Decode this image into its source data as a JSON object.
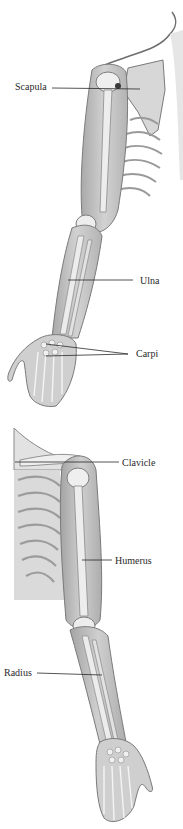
{
  "diagram": {
    "colors": {
      "background": "#ffffff",
      "skin": "#c9c9c9",
      "skin_dark": "#9a9a9a",
      "bone": "#ececec",
      "outline": "#6e6e6e",
      "leader_line": "#2a2a2a",
      "label_text": "#2a2a2a"
    },
    "figures": [
      {
        "id": "posterior-view",
        "labels": [
          {
            "text": "Scapula",
            "x": 15,
            "y": 80,
            "line": [
              [
                52,
                88
              ],
              [
                140,
                89
              ]
            ]
          },
          {
            "text": "Ulna",
            "x": 140,
            "y": 277,
            "line": [
              [
                68,
                280
              ],
              [
                133,
                280
              ]
            ]
          },
          {
            "text": "Carpi",
            "x": 136,
            "y": 349,
            "lines": [
              [
                [
                  46,
                  344
                ],
                [
                  128,
                  354
                ]
              ],
              [
                [
                  46,
                  356
                ],
                [
                  128,
                  354
                ]
              ]
            ]
          }
        ]
      },
      {
        "id": "anterior-view",
        "labels": [
          {
            "text": "Clavicle",
            "x": 122,
            "y": 457,
            "line": [
              [
                15,
                462
              ],
              [
                119,
                462
              ]
            ]
          },
          {
            "text": "Humerus",
            "x": 115,
            "y": 555,
            "line": [
              [
                82,
                560
              ],
              [
                112,
                560
              ]
            ]
          },
          {
            "text": "Radius",
            "x": 4,
            "y": 666,
            "line": [
              [
                37,
                673
              ],
              [
                102,
                675
              ]
            ]
          }
        ]
      }
    ]
  }
}
